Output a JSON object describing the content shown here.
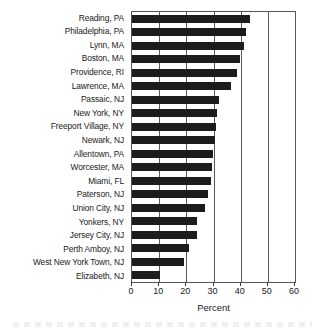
{
  "chart_data": {
    "type": "bar",
    "orientation": "horizontal",
    "title": "",
    "subtitle": "",
    "xlabel": "Percent",
    "ylabel": "",
    "xlim": [
      0,
      60
    ],
    "xticks": [
      0,
      10,
      20,
      30,
      40,
      50,
      60
    ],
    "xtick_labels": [
      "0",
      "10",
      "20",
      "30",
      "40",
      "50",
      "60"
    ],
    "grid": "vertical",
    "legend": "none",
    "bar_color": "#1c1c1c",
    "axis_color": "#555555",
    "categories": [
      "Reading, PA",
      "Philadelphia, PA",
      "Lynn, MA",
      "Boston, MA",
      "Providence, RI",
      "Lawrence, MA",
      "Passaic, NJ",
      "New York, NY",
      "Freeport Village, NY",
      "Newark, NJ",
      "Allentown, PA",
      "Worcester, MA",
      "Miami, FL",
      "Paterson, NJ",
      "Union City, NJ",
      "Yonkers, NY",
      "Jersey City, NJ",
      "Perth Amboy, NJ",
      "West New York Town, NJ",
      "Elizabeth, NJ"
    ],
    "values": [
      43.4,
      41.9,
      41.2,
      39.7,
      38.7,
      36.6,
      32.0,
      31.2,
      30.9,
      30.5,
      29.9,
      29.5,
      29.1,
      28.1,
      26.9,
      24.1,
      24.1,
      20.8,
      19.0,
      10.2
    ]
  }
}
